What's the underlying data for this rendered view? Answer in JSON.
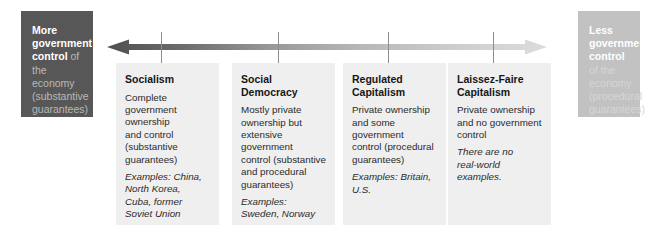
{
  "figure": {
    "accent_dark": "#575757",
    "accent_light": "#c2c2c2",
    "column_bg": "#efefef",
    "tick_color": "#8d8d8d"
  },
  "left_endcap": {
    "name": "more-government-control",
    "strong_text": "More government control",
    "soft_text": " of the economy (substantive guarantees)"
  },
  "right_endcap": {
    "name": "less-government-control",
    "strong_text": "Less government control",
    "soft_text": " of the economy (procedural guarantees)"
  },
  "axis": {
    "direction": "double-headed",
    "left_label_ref": "More government control",
    "right_label_ref": "Less government control",
    "tick_count": 4
  },
  "columns": [
    {
      "id": "socialism",
      "title": "Socialism",
      "body": "Complete\ngovernment\nownership\nand control\n(substantive\nguarantees)",
      "examples": "Examples: China,\nNorth Korea,\nCuba, former\nSoviet Union"
    },
    {
      "id": "social-democracy",
      "title": "Social\nDemocracy",
      "body": "Mostly private\nownership but\nextensive government\ncontrol (substantive\nand procedural\nguarantees)",
      "examples": "Examples:\nSweden, Norway"
    },
    {
      "id": "regulated-capitalism",
      "title": "Regulated\nCapitalism",
      "body": "Private ownership\nand some government\ncontrol (procedural\nguarantees)",
      "examples": "Examples: Britain,\nU.S."
    },
    {
      "id": "laissez-faire-capitalism",
      "title": "Laissez-Faire\nCapitalism",
      "body": "Private ownership\nand no government\ncontrol",
      "examples": "There are no\nreal-world examples."
    }
  ]
}
